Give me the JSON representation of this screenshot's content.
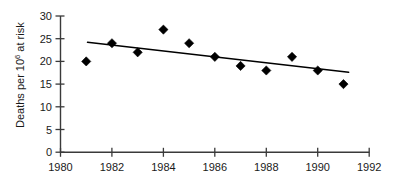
{
  "chart_data": {
    "type": "scatter",
    "title": "",
    "subtitle": "",
    "xlabel": "",
    "ylabel": "Deaths per 10",
    "ylabel_superscript": "6",
    "ylabel_suffix": " at risk",
    "ylabel_full": "Deaths per 10^6 at risk",
    "xlim": [
      1980,
      1992
    ],
    "ylim": [
      0,
      30
    ],
    "grid": false,
    "legend": null,
    "x": [
      1981,
      1982,
      1983,
      1984,
      1985,
      1986,
      1987,
      1988,
      1989,
      1990,
      1991
    ],
    "values": [
      20,
      24,
      22,
      27,
      24,
      21,
      19,
      18,
      21,
      18,
      15
    ],
    "series": [
      {
        "name": "Deaths per million at risk",
        "marker": "filled-diamond",
        "color": "#000000",
        "x": [
          1981,
          1982,
          1983,
          1984,
          1985,
          1986,
          1987,
          1988,
          1989,
          1990,
          1991
        ],
        "values": [
          20,
          24,
          22,
          27,
          24,
          21,
          19,
          18,
          21,
          18,
          15
        ]
      },
      {
        "name": "trend-line",
        "type": "line",
        "color": "#000000",
        "x": [
          1981.05,
          1991.2
        ],
        "values": [
          24.2,
          17.6
        ]
      }
    ],
    "xticks": [
      1980,
      1982,
      1984,
      1986,
      1988,
      1990,
      1992
    ],
    "xticklabels": [
      "1980",
      "1982",
      "1984",
      "1986",
      "1988",
      "1990",
      "1992"
    ],
    "yticks": [
      0,
      5,
      10,
      15,
      20,
      25,
      30
    ],
    "yticklabels": [
      "0",
      "5",
      "10",
      "15",
      "20",
      "25",
      "30"
    ],
    "colors": {
      "marker": "#000000",
      "trend": "#000000",
      "axis": "#3a3a3a",
      "text": "#1a1a1a",
      "background": "#ffffff"
    }
  }
}
